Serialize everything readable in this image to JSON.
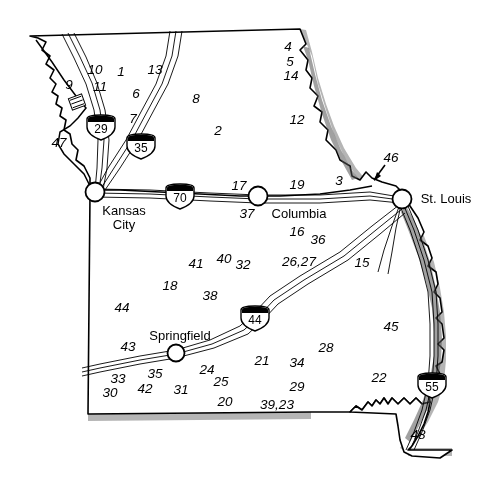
{
  "map": {
    "title": "Missouri highway and site location map",
    "background_color": "#ffffff",
    "outline_color": "#000000",
    "shadow_color": "#9a9a9a",
    "road_color": "#000000",
    "cities": [
      {
        "name": "Kansas City",
        "line1": "Kansas",
        "line2": "City",
        "x": 95,
        "y": 192,
        "label_x": 124,
        "label_y": 218
      },
      {
        "name": "Columbia",
        "line1": "Columbia",
        "line2": "",
        "x": 258,
        "y": 196,
        "label_x": 299,
        "label_y": 214
      },
      {
        "name": "St. Louis",
        "line1": "St.  Louis",
        "line2": "",
        "x": 402,
        "y": 199,
        "label_x": 446,
        "label_y": 199
      },
      {
        "name": "Springfield",
        "line1": "Springfield",
        "line2": "",
        "x": 176,
        "y": 353,
        "label_x": 180,
        "label_y": 336
      }
    ],
    "interstates": [
      {
        "number": "29",
        "x": 101,
        "y": 127
      },
      {
        "number": "35",
        "x": 141,
        "y": 146
      },
      {
        "number": "70",
        "x": 180,
        "y": 196
      },
      {
        "number": "44",
        "x": 255,
        "y": 318
      },
      {
        "number": "55",
        "x": 432,
        "y": 385
      }
    ],
    "site_labels": [
      {
        "text": "10",
        "x": 95,
        "y": 70
      },
      {
        "text": "1",
        "x": 121,
        "y": 72
      },
      {
        "text": "13",
        "x": 155,
        "y": 70
      },
      {
        "text": "9",
        "x": 69,
        "y": 85
      },
      {
        "text": "11",
        "x": 100,
        "y": 87
      },
      {
        "text": "6",
        "x": 136,
        "y": 94
      },
      {
        "text": "8",
        "x": 196,
        "y": 99
      },
      {
        "text": "7",
        "x": 133,
        "y": 119
      },
      {
        "text": "2",
        "x": 218,
        "y": 131
      },
      {
        "text": "47",
        "x": 59,
        "y": 143
      },
      {
        "text": "4",
        "x": 288,
        "y": 47
      },
      {
        "text": "5",
        "x": 290,
        "y": 62
      },
      {
        "text": "14",
        "x": 291,
        "y": 76
      },
      {
        "text": "12",
        "x": 297,
        "y": 120
      },
      {
        "text": "46",
        "x": 391,
        "y": 158
      },
      {
        "text": "3",
        "x": 339,
        "y": 181
      },
      {
        "text": "17",
        "x": 239,
        "y": 186
      },
      {
        "text": "19",
        "x": 297,
        "y": 185
      },
      {
        "text": "37",
        "x": 247,
        "y": 214
      },
      {
        "text": "16",
        "x": 297,
        "y": 232
      },
      {
        "text": "36",
        "x": 318,
        "y": 240
      },
      {
        "text": "26,27",
        "x": 299,
        "y": 262
      },
      {
        "text": "15",
        "x": 362,
        "y": 263
      },
      {
        "text": "41",
        "x": 196,
        "y": 264
      },
      {
        "text": "40",
        "x": 224,
        "y": 259
      },
      {
        "text": "32",
        "x": 243,
        "y": 265
      },
      {
        "text": "18",
        "x": 170,
        "y": 286
      },
      {
        "text": "38",
        "x": 210,
        "y": 296
      },
      {
        "text": "44",
        "x": 122,
        "y": 308
      },
      {
        "text": "45",
        "x": 391,
        "y": 327
      },
      {
        "text": "43",
        "x": 128,
        "y": 347
      },
      {
        "text": "28",
        "x": 326,
        "y": 348
      },
      {
        "text": "21",
        "x": 262,
        "y": 361
      },
      {
        "text": "34",
        "x": 297,
        "y": 363
      },
      {
        "text": "33",
        "x": 118,
        "y": 379
      },
      {
        "text": "35",
        "x": 155,
        "y": 374
      },
      {
        "text": "24",
        "x": 207,
        "y": 370
      },
      {
        "text": "30",
        "x": 110,
        "y": 393
      },
      {
        "text": "42",
        "x": 145,
        "y": 389
      },
      {
        "text": "31",
        "x": 181,
        "y": 390
      },
      {
        "text": "25",
        "x": 221,
        "y": 382
      },
      {
        "text": "29",
        "x": 297,
        "y": 387
      },
      {
        "text": "22",
        "x": 379,
        "y": 378
      },
      {
        "text": "20",
        "x": 225,
        "y": 402
      },
      {
        "text": "39,23",
        "x": 277,
        "y": 405
      },
      {
        "text": "48",
        "x": 418,
        "y": 435
      }
    ]
  }
}
